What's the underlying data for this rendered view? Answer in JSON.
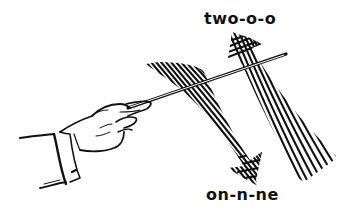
{
  "figure": {
    "labels": {
      "upbeat": "two-o-o",
      "downbeat": "on-n-ne"
    },
    "icons": {
      "hand": "conductor-hand-icon",
      "baton": "baton-icon",
      "down_arrow": "downbeat-arrow-icon",
      "up_arrow": "upbeat-arrow-icon"
    },
    "colors": {
      "ink": "#111111",
      "background": "#ffffff"
    }
  }
}
